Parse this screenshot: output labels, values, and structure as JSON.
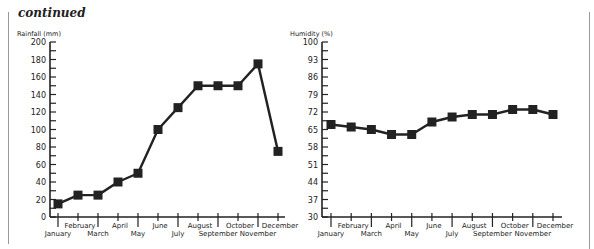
{
  "page": {
    "title": "continued"
  },
  "chart_data": [
    {
      "type": "line",
      "title": "",
      "ylabel": "Rainfall (mm)",
      "xlabel": "",
      "ylim": [
        0,
        200
      ],
      "yticks": [
        0,
        20,
        40,
        60,
        80,
        100,
        120,
        140,
        160,
        180,
        200
      ],
      "categories": [
        "January",
        "February",
        "March",
        "April",
        "May",
        "June",
        "July",
        "August",
        "September",
        "October",
        "November",
        "December"
      ],
      "values": [
        15,
        25,
        25,
        40,
        50,
        100,
        125,
        150,
        150,
        150,
        175,
        75
      ],
      "marker": "square",
      "grid": false,
      "legend": null
    },
    {
      "type": "line",
      "title": "",
      "ylabel": "Humidity (%)",
      "xlabel": "",
      "ylim": [
        30,
        100
      ],
      "yticks": [
        30,
        37,
        44,
        51,
        58,
        65,
        72,
        79,
        86,
        93,
        100
      ],
      "categories": [
        "January",
        "February",
        "March",
        "April",
        "May",
        "June",
        "July",
        "August",
        "September",
        "October",
        "November",
        "December"
      ],
      "values": [
        67,
        66,
        65,
        63,
        63,
        68,
        70,
        71,
        71,
        73,
        73,
        71
      ],
      "marker": "square",
      "grid": false,
      "legend": null
    }
  ],
  "colors": {
    "line": "#222222",
    "border": "#9a9a9a"
  }
}
